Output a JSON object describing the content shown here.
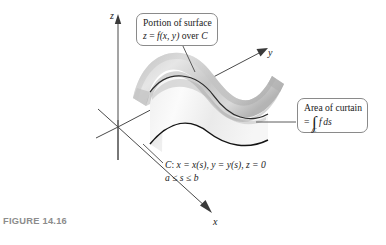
{
  "figure": {
    "caption": "FIGURE 14.16",
    "axes": {
      "z_label": "z",
      "y_label": "y",
      "x_label": "x"
    },
    "callout_surface": {
      "line1": "Portion of surface",
      "line2_lhs": "z",
      "line2_eq": " = ",
      "line2_fn": "f",
      "line2_args": "(x, y)",
      "line2_tail": " over ",
      "line2_curve": "C"
    },
    "callout_area": {
      "line1": "Area of curtain",
      "line2_eq": "=",
      "integral_symbol": "∫",
      "integral_subscript": "C",
      "integrand_f": "f",
      "integrand_ds": "ds"
    },
    "curve_label": {
      "line1_name": "C",
      "line1_colon": ": ",
      "line1_x": "x = x(s)",
      "line1_sep1": ", ",
      "line1_y": "y = y(s)",
      "line1_sep2": ", ",
      "line1_z": "z = 0",
      "line2": "a ≤ s ≤ b"
    },
    "colors": {
      "surface_light": "#e3e3e3",
      "surface_mid": "#c9c9c9",
      "surface_dark": "#a8a8a8",
      "curtain_light": "#f4f4f4",
      "curtain_mid": "#dcdcdc",
      "axis": "#4a4a4a",
      "curve": "#1c1c1c",
      "caption": "#8c8c8c",
      "callout_border": "#8a8a8a"
    }
  }
}
